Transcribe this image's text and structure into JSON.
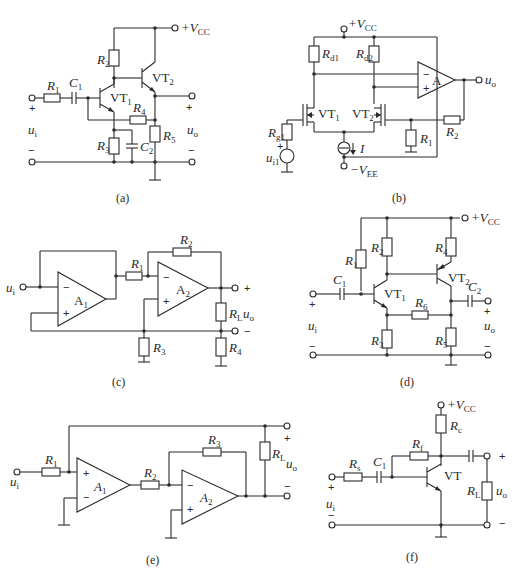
{
  "figure": {
    "panels": [
      {
        "id": "a",
        "caption": "(a)",
        "components": [
          "R1",
          "C1",
          "VT1",
          "R2",
          "VT2",
          "R3",
          "C2",
          "R4",
          "R5"
        ],
        "supply": "+VCC",
        "input": "ui",
        "output": "uo"
      },
      {
        "id": "b",
        "caption": "(b)",
        "components": [
          "Rd1",
          "Rd2",
          "VT1",
          "VT2",
          "Rg1",
          "ui1",
          "I",
          "R1",
          "R2",
          "A"
        ],
        "supply": "+VCC",
        "supply_neg": "-VEE",
        "output": "uo"
      },
      {
        "id": "c",
        "caption": "(c)",
        "components": [
          "A1",
          "R1",
          "A2",
          "R2",
          "R3",
          "RL",
          "R4"
        ],
        "input": "ui",
        "output": "uo"
      },
      {
        "id": "d",
        "caption": "(d)",
        "components": [
          "R1",
          "R2",
          "C1",
          "VT1",
          "R3",
          "R6",
          "R4",
          "VT2",
          "C2",
          "R5"
        ],
        "supply": "+VCC",
        "input": "ui",
        "output": "uo"
      },
      {
        "id": "e",
        "caption": "(e)",
        "components": [
          "R1",
          "A1",
          "R2",
          "R3",
          "A2",
          "RL"
        ],
        "input": "ui",
        "output": "uo"
      },
      {
        "id": "f",
        "caption": "(f)",
        "components": [
          "Rs",
          "C1",
          "Rf",
          "Rc",
          "VT",
          "RL"
        ],
        "supply": "+VCC",
        "input": "ui",
        "output": "uo"
      }
    ]
  },
  "labels": {
    "vcc": "+V",
    "vcc_sub": "CC",
    "vee": "−V",
    "vee_sub": "EE",
    "plus": "+",
    "minus": "−",
    "u": "u",
    "i_sub": "i",
    "o_sub": "o",
    "i1_sub": "i1",
    "R": "R",
    "C": "C",
    "VT": "VT",
    "A": "A",
    "I": "I",
    "s1": "1",
    "s2": "2",
    "s3": "3",
    "s4": "4",
    "s5": "5",
    "s6": "6",
    "L": "L",
    "d1": "d1",
    "d2": "d2",
    "g1": "g1",
    "s": "s",
    "f": "f",
    "c": "c",
    "cap_a": "(a)",
    "cap_b": "(b)",
    "cap_c": "(c)",
    "cap_d": "(d)",
    "cap_e": "(e)",
    "cap_f": "(f)"
  }
}
